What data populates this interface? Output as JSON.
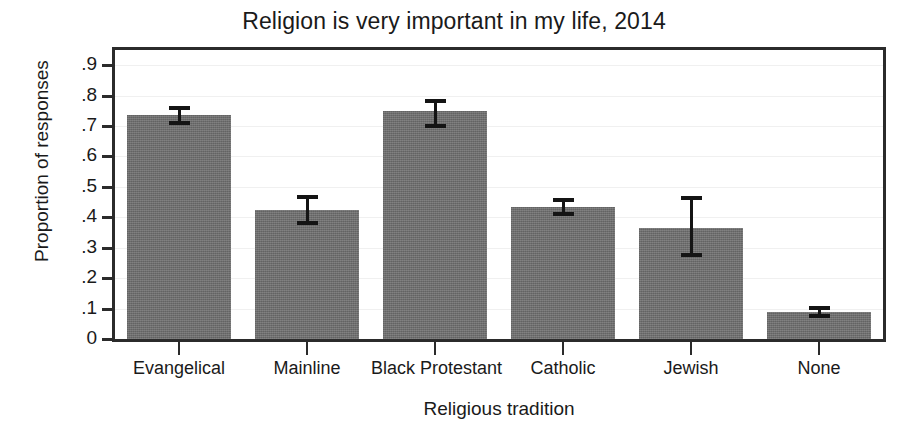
{
  "chart_data": {
    "type": "bar",
    "title": "Religion is very important in my life, 2014",
    "xlabel": "Religious tradition",
    "ylabel": "Proportion of responses",
    "categories": [
      "Evangelical",
      "Mainline",
      "Black Protestant",
      "Catholic",
      "Jewish",
      "None"
    ],
    "values": [
      0.735,
      0.425,
      0.75,
      0.435,
      0.365,
      0.09
    ],
    "error_low": [
      0.705,
      0.375,
      0.695,
      0.405,
      0.27,
      0.07
    ],
    "error_high": [
      0.765,
      0.475,
      0.79,
      0.465,
      0.47,
      0.11
    ],
    "ylim": [
      0,
      0.95
    ],
    "ytick_values": [
      0,
      0.1,
      0.2,
      0.3,
      0.4,
      0.5,
      0.6,
      0.7,
      0.8,
      0.9
    ],
    "ytick_labels": [
      "0",
      ".1",
      ".2",
      ".3",
      ".4",
      ".5",
      ".6",
      ".7",
      ".8",
      ".9"
    ],
    "grid": true,
    "legend": false,
    "bar_color": "#6e6e6e",
    "error_color": "#141414",
    "axis_color": "#2b2b2b"
  }
}
